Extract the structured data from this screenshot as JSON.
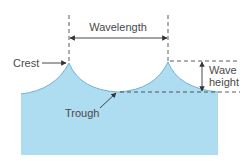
{
  "diagram": {
    "labels": {
      "wavelength": "Wavelength",
      "crest": "Crest",
      "trough": "Trough",
      "wave_height_line1": "Wave",
      "wave_height_line2": "height"
    },
    "colors": {
      "water_fill": "#aedcf0",
      "water_edge": "#6fb3d6",
      "line": "#333333",
      "text": "#4a4a4a"
    }
  }
}
